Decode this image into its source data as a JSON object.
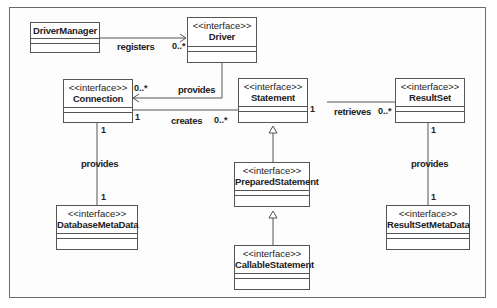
{
  "diagram": {
    "type": "UML class diagram",
    "classes": [
      {
        "id": "DriverManager",
        "stereotype": "",
        "name": "DriverManager"
      },
      {
        "id": "Driver",
        "stereotype": "<<interface>>",
        "name": "Driver"
      },
      {
        "id": "Connection",
        "stereotype": "<<interface>>",
        "name": "Connection"
      },
      {
        "id": "Statement",
        "stereotype": "<<interface>>",
        "name": "Statement"
      },
      {
        "id": "ResultSet",
        "stereotype": "<<interface>>",
        "name": "ResultSet"
      },
      {
        "id": "PreparedStatement",
        "stereotype": "<<interface>>",
        "name": "PreparedStatement"
      },
      {
        "id": "DatabaseMetaData",
        "stereotype": "<<interface>>",
        "name": "DatabaseMetaData"
      },
      {
        "id": "CallableStatement",
        "stereotype": "<<interface>>",
        "name": "CallableStatement"
      },
      {
        "id": "ResultSetMetaData",
        "stereotype": "<<interface>>",
        "name": "ResultSetMetaData"
      }
    ],
    "relations": [
      {
        "from": "DriverManager",
        "to": "Driver",
        "label": "registers",
        "target_mult": "0..*",
        "kind": "association-navigable"
      },
      {
        "from": "Driver",
        "to": "Connection",
        "label": "provides",
        "target_mult": "0..*",
        "kind": "association-navigable"
      },
      {
        "from": "Connection",
        "to": "Statement",
        "label": "creates",
        "source_mult": "1",
        "target_mult": "0..*",
        "kind": "association"
      },
      {
        "from": "Statement",
        "to": "ResultSet",
        "label": "retrieves",
        "source_mult": "1",
        "target_mult": "0..*",
        "kind": "association"
      },
      {
        "from": "Connection",
        "to": "DatabaseMetaData",
        "label": "provides",
        "source_mult": "1",
        "target_mult": "1",
        "kind": "association"
      },
      {
        "from": "ResultSet",
        "to": "ResultSetMetaData",
        "label": "provides",
        "source_mult": "1",
        "target_mult": "1",
        "kind": "association"
      },
      {
        "from": "PreparedStatement",
        "to": "Statement",
        "label": "",
        "kind": "generalization"
      },
      {
        "from": "CallableStatement",
        "to": "PreparedStatement",
        "label": "",
        "kind": "generalization"
      }
    ]
  },
  "labels": {
    "registers": "registers",
    "provides_driver": "provides",
    "creates": "creates",
    "retrieves": "retrieves",
    "provides_db": "provides",
    "provides_rs": "provides"
  },
  "mults": {
    "driver_0n": "0..*",
    "conn_0n": "0..*",
    "conn_1_creates": "1",
    "stmt_0n": "0..*",
    "stmt_1": "1",
    "rs_0n": "0..*",
    "conn_1_down": "1",
    "dbmd_1": "1",
    "rs_1_down": "1",
    "rsmd_1": "1"
  },
  "colors": {
    "line": "#555555",
    "frame": "#6a6a6a",
    "text": "#222222"
  }
}
